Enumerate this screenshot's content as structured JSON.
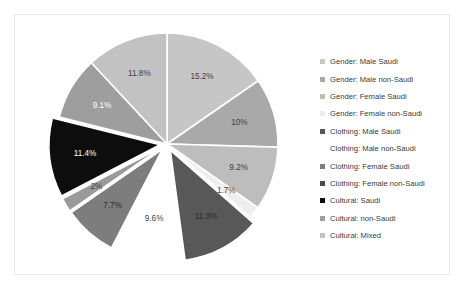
{
  "chart_data": {
    "type": "pie",
    "title": "",
    "subtitle": "",
    "xlabel": "",
    "ylabel": "",
    "legend_position": "right",
    "grid": false,
    "start_angle_deg": -90,
    "direction": "clockwise",
    "categories": [
      "Gender: Male Saudi",
      "Gender: Male non-Saudi",
      "Gender: Female Saudi",
      "Gender: Female non-Saudi",
      "Clothing: Male Saudi",
      "Clothing: Male non-Saudi",
      "Clothing: Female Saudi",
      "Clothing: Female non-Saudi",
      "Cultural: Saudi",
      "Cultural: non-Saudi",
      "Cultural: Mixed"
    ],
    "values": [
      15.2,
      10,
      9.2,
      1.7,
      11.3,
      9.6,
      7.7,
      2,
      11.4,
      9.1,
      11.8
    ],
    "labels": [
      "15.2%",
      "10%",
      "9.2%",
      "1.7%",
      "11.3%",
      "9.6%",
      "7.7%",
      "2%",
      "11.4%",
      "9.1%",
      "11.8%"
    ],
    "colors": [
      "#c6c6c6",
      "#a9a9a9",
      "#bdbdbd",
      "#eeeeee",
      "#585858",
      "#ffffff",
      "#7d7d7d",
      "#9a9a9a",
      "#0d0d0d",
      "#9e9e9e",
      "#c2c2c2"
    ],
    "exploded": [
      false,
      false,
      false,
      false,
      true,
      false,
      true,
      true,
      true,
      false,
      false
    ],
    "label_text_colors": [
      "dark",
      "dark",
      "dark",
      "dark",
      "mid",
      "dark",
      "mid",
      "dark",
      "light",
      "light",
      "dark"
    ]
  },
  "legend": {
    "items": [
      {
        "label": "Gender: Male Saudi",
        "color": "#c6c6c6"
      },
      {
        "label": "Gender: Male non-Saudi",
        "color": "#a9a9a9"
      },
      {
        "label": "Gender: Female Saudi",
        "color": "#bdbdbd"
      },
      {
        "label": "Gender: Female non-Saudi",
        "color": "#eeeeee"
      },
      {
        "label": "Clothing: Male Saudi",
        "color": "#585858"
      },
      {
        "label": "Clothing: Male non-Saudi",
        "color": "#ffffff"
      },
      {
        "label": "Clothing: Female Saudi",
        "color": "#7d7d7d"
      },
      {
        "label": "Clothing: Female non-Saudi",
        "color": "#4a4a4a"
      },
      {
        "label": "Cultural: Saudi",
        "color": "#0d0d0d"
      },
      {
        "label": "Cultural: non-Saudi",
        "color": "#9e9e9e"
      },
      {
        "label": "Cultural: Mixed",
        "color": "#c2c2c2"
      }
    ]
  },
  "figure": {
    "background_color": "#ffffff",
    "border_color": "#e9eaec",
    "slice_separator_color": "#ffffff"
  }
}
